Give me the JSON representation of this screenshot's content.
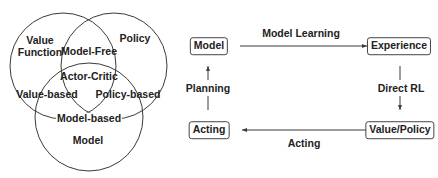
{
  "venn": {
    "circles": [
      {
        "id": "value-function",
        "label": "Value\nFunction",
        "label_line1": "Value",
        "label_line2": "Function"
      },
      {
        "id": "policy",
        "label": "Policy"
      },
      {
        "id": "model",
        "label": "Model"
      }
    ],
    "intersections": {
      "value_policy": "Model-Free",
      "all_three": "Actor-Critic",
      "value_model": "Value-based",
      "policy_model": "Policy-based",
      "model_boundary": "Model-based"
    }
  },
  "flow": {
    "nodes": {
      "model": "Model",
      "experience": "Experience",
      "value_policy": "Value/Policy",
      "acting": "Acting"
    },
    "edges": {
      "model_learning": "Model Learning",
      "direct_rl": "Direct RL",
      "acting": "Acting",
      "planning": "Planning"
    }
  },
  "colors": {
    "stroke": "#3a3a3a",
    "text": "#222222",
    "background": "#ffffff"
  }
}
